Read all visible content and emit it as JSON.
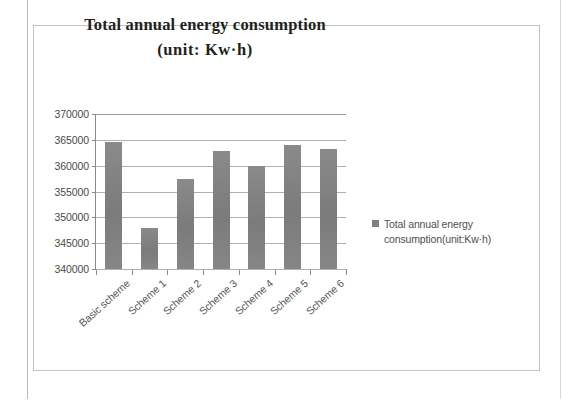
{
  "chart_data": {
    "type": "bar",
    "title": "Total annual energy consumption (unit: Kw·h)",
    "title_line1": "Total annual energy consumption",
    "title_line2": "(unit: Kw·h)",
    "categories": [
      "Basic scheme",
      "Scheme 1",
      "Scheme 2",
      "Scheme 3",
      "Scheme 4",
      "Scheme 5",
      "Scheme 6"
    ],
    "values": [
      364500,
      348000,
      357500,
      362800,
      360000,
      364000,
      363200
    ],
    "series": [
      {
        "name": "Total annual energy consumption(unit:Kw·h)",
        "values": [
          364500,
          348000,
          357500,
          362800,
          360000,
          364000,
          363200
        ]
      }
    ],
    "xlabel": "",
    "ylabel": "",
    "ylim": [
      340000,
      370000
    ],
    "ytick_step": 5000,
    "yticks": [
      370000,
      365000,
      360000,
      355000,
      350000,
      345000,
      340000
    ],
    "ytick_labels": [
      "370000",
      "365000",
      "360000",
      "355000",
      "350000",
      "345000",
      "340000"
    ],
    "grid": true,
    "legend_position": "right",
    "bar_color": "#808080",
    "grid_color": "#b0b0b0",
    "axis_color": "#8a8a8a",
    "background": "#ffffff"
  },
  "legend": {
    "entries": [
      {
        "label": "Total annual energy consumption(unit:Kw·h)",
        "color": "#808080",
        "marker": "square-swatch"
      }
    ]
  }
}
